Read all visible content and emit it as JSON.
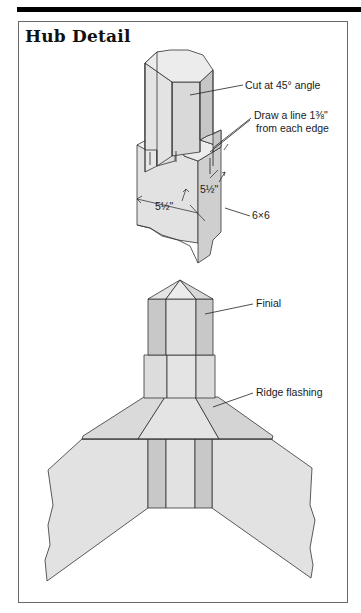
{
  "title": "Hub Detail",
  "colors": {
    "rule": "#000000",
    "frame": "#6a6a6a",
    "light_fill": "#e4e4e4",
    "mid_fill": "#d2d2d2",
    "dark_fill": "#c0c0c0",
    "stroke": "#333333"
  },
  "post_detail": {
    "callouts": {
      "cut": "Cut at 45° angle",
      "draw_line_1": "Draw a line 1⅜\"",
      "draw_line_2": "from each edge",
      "size": "6×6"
    },
    "dimensions": {
      "width": "5½\"",
      "depth": "5½\""
    }
  },
  "assembly_detail": {
    "callouts": {
      "finial": "Finial",
      "ridge_flashing": "Ridge flashing"
    }
  }
}
